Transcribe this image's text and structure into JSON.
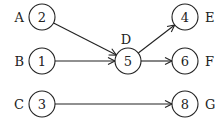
{
  "diagram": {
    "type": "directed-graph",
    "colors": {
      "stroke": "#222222",
      "background": "#ffffff"
    },
    "node_radius": 13,
    "nodes": [
      {
        "id": "A",
        "label": "A",
        "value": "2",
        "x": 42,
        "y": 17,
        "label_side": "left"
      },
      {
        "id": "B",
        "label": "B",
        "value": "1",
        "x": 42,
        "y": 61,
        "label_side": "left"
      },
      {
        "id": "C",
        "label": "C",
        "value": "3",
        "x": 42,
        "y": 104,
        "label_side": "left"
      },
      {
        "id": "D",
        "label": "D",
        "value": "5",
        "x": 128,
        "y": 61,
        "label_side": "top"
      },
      {
        "id": "E",
        "label": "E",
        "value": "4",
        "x": 185,
        "y": 17,
        "label_side": "right"
      },
      {
        "id": "F",
        "label": "F",
        "value": "6",
        "x": 185,
        "y": 61,
        "label_side": "right"
      },
      {
        "id": "G",
        "label": "G",
        "value": "8",
        "x": 185,
        "y": 104,
        "label_side": "right"
      }
    ],
    "edges": [
      {
        "from": "A",
        "to": "D"
      },
      {
        "from": "B",
        "to": "D"
      },
      {
        "from": "D",
        "to": "E"
      },
      {
        "from": "D",
        "to": "F"
      },
      {
        "from": "C",
        "to": "G"
      }
    ]
  }
}
